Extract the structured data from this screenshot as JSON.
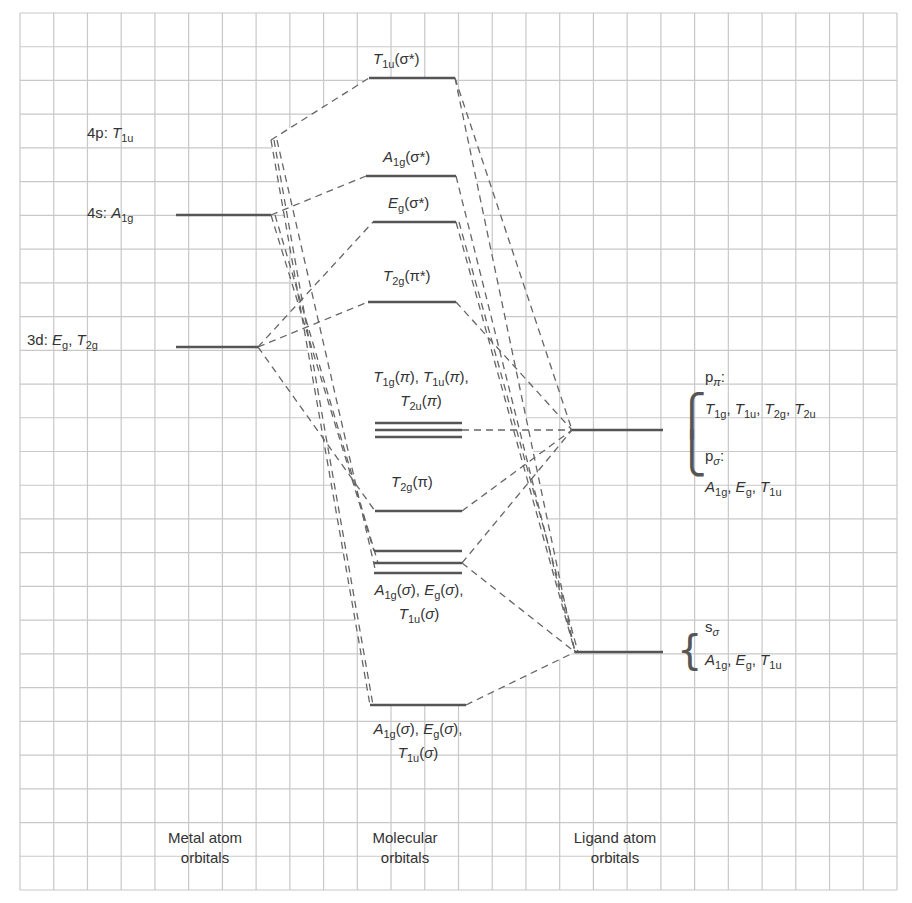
{
  "diagram": {
    "type": "molecular-orbital-energy-diagram",
    "grid": {
      "x0": 20,
      "y0": 13,
      "x1": 897,
      "y1": 890,
      "cells": 26,
      "color": "#c8c8c8"
    },
    "colors": {
      "level": "#555555",
      "dash": "#666666",
      "text": "#333333",
      "background": "#ffffff"
    },
    "columns": {
      "metal": {
        "title_line1": "Metal atom",
        "title_line2": "orbitals"
      },
      "molecular": {
        "title_line1": "Molecular",
        "title_line2": "orbitals"
      },
      "ligand": {
        "title_line1": "Ligand atom",
        "title_line2": "orbitals"
      }
    },
    "metal_orbitals": [
      {
        "id": "4p",
        "prefix": "4p: ",
        "sym": "T",
        "sub": "1u",
        "suffix": "",
        "y": 140
      },
      {
        "id": "4s",
        "prefix": "4s: ",
        "sym": "A",
        "sub": "1g",
        "suffix": "",
        "y": 215
      },
      {
        "id": "3d",
        "prefix": "3d: ",
        "sym": "E",
        "sub": "g",
        "sym2": "T",
        "sub2": "2g",
        "y": 347
      }
    ],
    "molecular_orbitals": [
      {
        "id": "t1u-sigma-star",
        "label": "T1u(σ*)",
        "sym": "T",
        "sub": "1u",
        "suffix": "(σ*)",
        "y": 78
      },
      {
        "id": "a1g-sigma-star",
        "label": "A1g(σ*)",
        "sym": "A",
        "sub": "1g",
        "suffix": "(σ*)",
        "y": 176
      },
      {
        "id": "eg-sigma-star",
        "label": "Eg(σ*)",
        "sym": "E",
        "sub": "g",
        "suffix": "(σ*)",
        "y": 222
      },
      {
        "id": "t2g-pi-star",
        "label": "T2g(π*)",
        "sym": "T",
        "sub": "2g",
        "suffix": "(π*)",
        "y": 302
      },
      {
        "id": "pi-nonbonding",
        "label_line1": "T1g(π), T1u(π),",
        "label_line2": "T2u(π)",
        "y": 430
      },
      {
        "id": "t2g-pi",
        "label": "T2g(π)",
        "sym": "T",
        "sub": "2g",
        "suffix": "(π)",
        "y": 511
      },
      {
        "id": "sigma-nonbonding",
        "label_line1": "A1g(σ), Eg(σ),",
        "label_line2": "T1u(σ)",
        "y": 563
      },
      {
        "id": "sigma-bonding",
        "label_line1": "A1g(σ), Eg(σ),",
        "label_line2": "T1u(σ)",
        "y": 705
      }
    ],
    "ligand_orbitals": [
      {
        "id": "p",
        "y": 430,
        "group1_title": "pπ:",
        "group1_syms": "T1g, T1u, T2g, T2u",
        "group2_title": "pσ:",
        "group2_syms": "A1g, Eg, T1u"
      },
      {
        "id": "s",
        "y": 652,
        "group1_title": "sσ",
        "group1_syms": "A1g, Eg, T1u"
      }
    ]
  }
}
